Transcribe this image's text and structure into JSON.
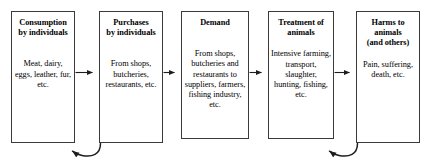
{
  "diagram": {
    "type": "flowchart",
    "orientation": "left-to-right",
    "background_color": "#ffffff",
    "line_color": "#3a3a3a",
    "text_color": "#000000",
    "nodes": [
      {
        "id": "consumption",
        "title": "Consumption\nby individuals",
        "title_line1": "Consumption",
        "title_line2": "by individuals",
        "body": "Meat, dairy, eggs, leather, fur, etc."
      },
      {
        "id": "purchases",
        "title": "Purchases\nby individuals",
        "title_line1": "Purchases",
        "title_line2": "by individuals",
        "body": "From shops, butcheries, restaurants, etc."
      },
      {
        "id": "demand",
        "title": "Demand",
        "title_line1": "Demand",
        "title_line2": "",
        "body": "From shops, butcheries and restaurants to suppliers, farmers, fishing industry, etc."
      },
      {
        "id": "treatment",
        "title": "Treatment of\nanimals",
        "title_line1": "Treatment of",
        "title_line2": "animals",
        "body": "Intensive farming, transport, slaughter, hunting, fishing, etc."
      },
      {
        "id": "harms",
        "title": "Harms to\nanimals\n(and others)",
        "title_line1": "Harms to",
        "title_line2": "animals",
        "title_line3": "(and others)",
        "body": "Pain, suffering, death, etc."
      }
    ],
    "connectors": [
      {
        "id": "arrow-consumption-purchases",
        "from": "consumption",
        "to": "purchases",
        "style": "straight",
        "direction": "right"
      },
      {
        "id": "arrow-purchases-demand",
        "from": "purchases",
        "to": "demand",
        "style": "straight",
        "direction": "right"
      },
      {
        "id": "arrow-demand-treatment",
        "from": "demand",
        "to": "treatment",
        "style": "straight",
        "direction": "right"
      },
      {
        "id": "arrow-treatment-harms",
        "from": "treatment",
        "to": "harms",
        "style": "straight",
        "direction": "right"
      },
      {
        "id": "feedback-purchases-consumption",
        "from": "purchases",
        "to": "consumption",
        "style": "curved",
        "direction": "left"
      },
      {
        "id": "feedback-harms-treatment",
        "from": "harms",
        "to": "treatment",
        "style": "curved",
        "direction": "left"
      }
    ]
  }
}
